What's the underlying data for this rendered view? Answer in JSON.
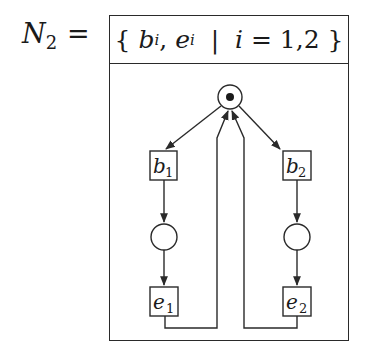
{
  "net": {
    "name": "N",
    "name_subscript": "2",
    "equals": "=",
    "header": {
      "open": "{",
      "elements": [
        "b",
        "e"
      ],
      "element_subscript": "i",
      "separator": ",",
      "bar": "|",
      "index_var": "i",
      "index_eq": "=",
      "index_values": "1,2",
      "close": "}"
    }
  },
  "diagram": {
    "places": [
      {
        "id": "p0",
        "cx": 230,
        "cy": 97,
        "r": 12,
        "tokens": 1
      },
      {
        "id": "p1",
        "cx": 164,
        "cy": 237,
        "r": 13,
        "tokens": 0
      },
      {
        "id": "p2",
        "cx": 297,
        "cy": 237,
        "r": 13,
        "tokens": 0
      }
    ],
    "transitions": [
      {
        "id": "b1",
        "label": "b",
        "sub": "1",
        "x": 150,
        "y": 151,
        "w": 27,
        "h": 29
      },
      {
        "id": "b2",
        "label": "b",
        "sub": "2",
        "x": 283,
        "y": 151,
        "w": 28,
        "h": 29
      },
      {
        "id": "e1",
        "label": "e",
        "sub": "1",
        "x": 150,
        "y": 287,
        "w": 28,
        "h": 29
      },
      {
        "id": "e2",
        "label": "e",
        "sub": "2",
        "x": 283,
        "y": 287,
        "w": 28,
        "h": 29
      }
    ],
    "arcs": [
      {
        "from": "p0",
        "to": "b1"
      },
      {
        "from": "p0",
        "to": "b2"
      },
      {
        "from": "b1",
        "to": "p1"
      },
      {
        "from": "p1",
        "to": "e1"
      },
      {
        "from": "b2",
        "to": "p2"
      },
      {
        "from": "p2",
        "to": "e2"
      },
      {
        "from": "e1",
        "to": "p0"
      },
      {
        "from": "e2",
        "to": "p0"
      }
    ],
    "stroke_color": "#2a2a2a"
  }
}
